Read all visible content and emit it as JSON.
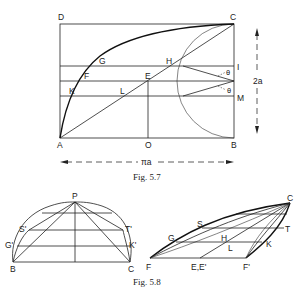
{
  "figures": [
    {
      "caption": "Fig. 5.7",
      "points": {
        "A": "A",
        "B": "B",
        "C": "C",
        "D": "D",
        "O": "O",
        "E": "E",
        "F": "F",
        "G": "G",
        "H": "H",
        "I": "I",
        "K": "K",
        "L": "L",
        "M": "M"
      },
      "angle_label_1": "θ",
      "angle_label_2": "θ",
      "height_label": "2a",
      "width_label": "πa"
    },
    {
      "caption": "Fig. 5.8",
      "left": {
        "points": {
          "P": "P",
          "B": "B",
          "C": "C",
          "S": "S'",
          "T": "T'",
          "G": "G'",
          "K": "K'"
        }
      },
      "right": {
        "points": {
          "C": "C",
          "S": "S",
          "T": "T",
          "G": "G",
          "H": "H",
          "L": "L",
          "K": "K",
          "F": "F",
          "E": "E,E'",
          "F2": "F'"
        }
      }
    }
  ]
}
